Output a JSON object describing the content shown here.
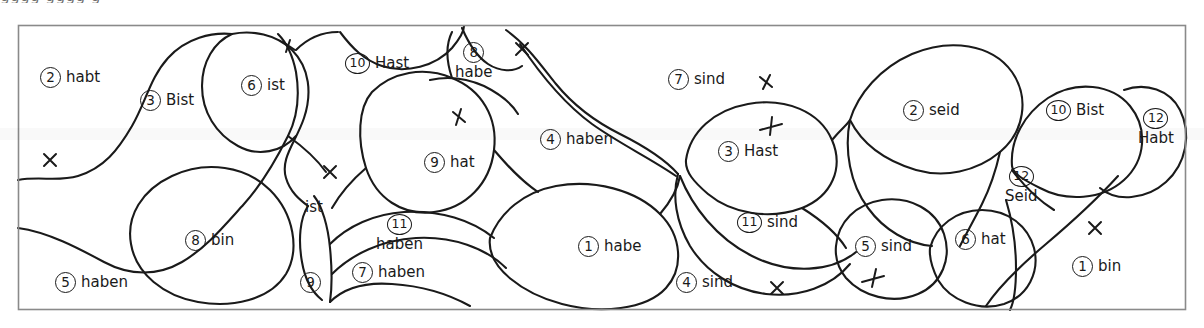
{
  "figure": {
    "kind": "hand-drawn-region-diagram",
    "clipped_text_above": "gggg          gggg   g",
    "frame": {
      "x": 18,
      "y": 25,
      "width": 1168,
      "height": 285,
      "color": "#8a8a8a"
    },
    "ink_color": "#1a1a1a"
  },
  "labels": [
    {
      "id": "r2-habt",
      "number": "2",
      "word": "habt",
      "x": 40,
      "y": 67,
      "layout": "inline"
    },
    {
      "id": "r3-bist",
      "number": "3",
      "word": "Bist",
      "x": 140,
      "y": 90,
      "layout": "inline"
    },
    {
      "id": "r6-ist",
      "number": "6",
      "word": "ist",
      "x": 241,
      "y": 75,
      "layout": "inline"
    },
    {
      "id": "r10-hast",
      "number": "10",
      "word": "Hast",
      "x": 345,
      "y": 53,
      "layout": "inline"
    },
    {
      "id": "r8-habe",
      "number": "8",
      "word": "habe",
      "x": 455,
      "y": 42,
      "layout": "stacked"
    },
    {
      "id": "r7-sind",
      "number": "7",
      "word": "sind",
      "x": 668,
      "y": 69,
      "layout": "inline"
    },
    {
      "id": "r2-seid",
      "number": "2",
      "word": "seid",
      "x": 903,
      "y": 100,
      "layout": "inline"
    },
    {
      "id": "r10-bist",
      "number": "10",
      "word": "Bist",
      "x": 1046,
      "y": 100,
      "layout": "inline"
    },
    {
      "id": "r12-habt",
      "number": "12",
      "word": "Habt",
      "x": 1138,
      "y": 108,
      "layout": "stacked"
    },
    {
      "id": "r4-haben",
      "number": "4",
      "word": "haben",
      "x": 540,
      "y": 129,
      "layout": "inline"
    },
    {
      "id": "r3-hast",
      "number": "3",
      "word": "Hast",
      "x": 718,
      "y": 141,
      "layout": "inline"
    },
    {
      "id": "r9-hat",
      "number": "9",
      "word": "hat",
      "x": 424,
      "y": 152,
      "layout": "inline"
    },
    {
      "id": "r12-seid",
      "number": "12",
      "word": "Seid",
      "x": 1005,
      "y": 166,
      "layout": "stacked"
    },
    {
      "id": "plain-ist",
      "number": "",
      "word": "ist",
      "x": 305,
      "y": 200,
      "layout": "inline"
    },
    {
      "id": "r11-haben",
      "number": "11",
      "word": "haben",
      "x": 376,
      "y": 214,
      "layout": "stacked"
    },
    {
      "id": "r11-sind",
      "number": "11",
      "word": "sind",
      "x": 737,
      "y": 212,
      "layout": "inline"
    },
    {
      "id": "r8-bin",
      "number": "8",
      "word": "bin",
      "x": 185,
      "y": 230,
      "layout": "inline"
    },
    {
      "id": "r5-sind",
      "number": "5",
      "word": "sind",
      "x": 855,
      "y": 236,
      "layout": "inline"
    },
    {
      "id": "r6-hat",
      "number": "6",
      "word": "hat",
      "x": 955,
      "y": 229,
      "layout": "inline"
    },
    {
      "id": "r7-haben",
      "number": "7",
      "word": "haben",
      "x": 352,
      "y": 262,
      "layout": "inline"
    },
    {
      "id": "r1-habe",
      "number": "1",
      "word": "habe",
      "x": 578,
      "y": 236,
      "layout": "inline"
    },
    {
      "id": "r1-bin",
      "number": "1",
      "word": "bin",
      "x": 1072,
      "y": 256,
      "layout": "inline"
    },
    {
      "id": "r5-haben",
      "number": "5",
      "word": "haben",
      "x": 55,
      "y": 272,
      "layout": "inline"
    },
    {
      "id": "r9-only",
      "number": "9",
      "word": "",
      "x": 300,
      "y": 272,
      "layout": "inline"
    },
    {
      "id": "r4-sind",
      "number": "4",
      "word": "sind",
      "x": 676,
      "y": 272,
      "layout": "inline"
    }
  ],
  "marks": [
    {
      "id": "mark-1",
      "type": "x-plain",
      "x": 50,
      "y": 160
    },
    {
      "id": "mark-2",
      "type": "x-slash",
      "x": 289,
      "y": 46
    },
    {
      "id": "mark-3",
      "type": "x-plain",
      "x": 330,
      "y": 172
    },
    {
      "id": "mark-4",
      "type": "x-slash",
      "x": 459,
      "y": 117
    },
    {
      "id": "mark-5",
      "type": "x-plain",
      "x": 522,
      "y": 49
    },
    {
      "id": "mark-6",
      "type": "x-plain",
      "x": 766,
      "y": 82
    },
    {
      "id": "mark-7",
      "type": "x-bar",
      "x": 770,
      "y": 127
    },
    {
      "id": "mark-8",
      "type": "x-plain",
      "x": 777,
      "y": 288
    },
    {
      "id": "mark-9",
      "type": "x-bar",
      "x": 873,
      "y": 280
    },
    {
      "id": "mark-10",
      "type": "x-plain",
      "x": 1095,
      "y": 228
    }
  ],
  "chart_data": {
    "type": "diagram",
    "title": "",
    "region_count": 25,
    "regions": [
      {
        "index": "2",
        "label": "habt"
      },
      {
        "index": "3",
        "label": "Bist"
      },
      {
        "index": "6",
        "label": "ist"
      },
      {
        "index": "10",
        "label": "Hast"
      },
      {
        "index": "8",
        "label": "habe"
      },
      {
        "index": "7",
        "label": "sind"
      },
      {
        "index": "2",
        "label": "seid"
      },
      {
        "index": "10",
        "label": "Bist"
      },
      {
        "index": "12",
        "label": "Habt"
      },
      {
        "index": "4",
        "label": "haben"
      },
      {
        "index": "3",
        "label": "Hast"
      },
      {
        "index": "9",
        "label": "hat"
      },
      {
        "index": "12",
        "label": "Seid"
      },
      {
        "index": "",
        "label": "ist"
      },
      {
        "index": "11",
        "label": "haben"
      },
      {
        "index": "11",
        "label": "sind"
      },
      {
        "index": "8",
        "label": "bin"
      },
      {
        "index": "5",
        "label": "sind"
      },
      {
        "index": "6",
        "label": "hat"
      },
      {
        "index": "7",
        "label": "haben"
      },
      {
        "index": "1",
        "label": "habe"
      },
      {
        "index": "1",
        "label": "bin"
      },
      {
        "index": "5",
        "label": "haben"
      },
      {
        "index": "9",
        "label": ""
      },
      {
        "index": "4",
        "label": "sind"
      }
    ],
    "mark_count": 10
  }
}
